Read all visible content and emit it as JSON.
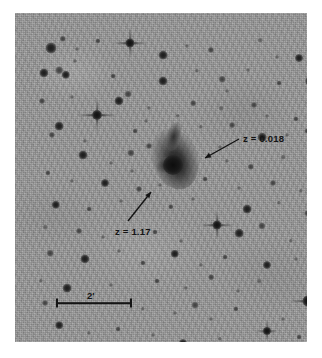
{
  "figure": {
    "kind": "astronomical-plate-image",
    "background_color": "#ffffff",
    "plate_color": "#9b9b9b",
    "ink_color": "#141414",
    "plate": {
      "left": 15,
      "top": 13,
      "width": 292,
      "height": 329
    }
  },
  "annotations": [
    {
      "name": "redshift-label-galaxy",
      "text": "z = 0.018",
      "label_x": 228,
      "label_y": 120,
      "font_size": 9.5,
      "arrow": {
        "x1": 224,
        "y1": 126,
        "x2": 190,
        "y2": 145
      }
    },
    {
      "name": "redshift-label-quasar",
      "text": "z = 1.17",
      "label_x": 100,
      "label_y": 213,
      "font_size": 9.5,
      "arrow": {
        "x1": 113,
        "y1": 208,
        "x2": 136,
        "y2": 179
      }
    }
  ],
  "scale_bar": {
    "name": "angular-scale-bar",
    "label": "2'",
    "value": 2,
    "unit": "arcmin",
    "x": 41,
    "y": 290,
    "length": 76,
    "label_x": 72,
    "label_y": 277,
    "font_size": 9.5
  },
  "galaxy": {
    "name": "central-galaxy",
    "x": 160,
    "y": 146,
    "halo_w": 46,
    "halo_h": 62,
    "nucleus_x": 158,
    "nucleus_y": 152,
    "nucleus_size": 20
  },
  "bright_stars": [
    {
      "x": 115,
      "y": 30,
      "core": 9,
      "spike_h": 34,
      "spike_v": 30
    },
    {
      "x": 82,
      "y": 102,
      "core": 10,
      "spike_h": 40,
      "spike_v": 34
    },
    {
      "x": 202,
      "y": 212,
      "core": 9,
      "spike_h": 34,
      "spike_v": 30
    },
    {
      "x": 293,
      "y": 288,
      "core": 11,
      "spike_h": 38,
      "spike_v": 34
    },
    {
      "x": 252,
      "y": 318,
      "core": 8,
      "spike_h": 22,
      "spike_v": 20
    }
  ],
  "stars": [
    {
      "x": 36,
      "y": 35,
      "r": 5.5,
      "c": ""
    },
    {
      "x": 48,
      "y": 26,
      "r": 3.2,
      "c": "faint"
    },
    {
      "x": 62,
      "y": 36,
      "r": 2.0,
      "c": "vfaint"
    },
    {
      "x": 83,
      "y": 28,
      "r": 2.6,
      "c": "faint"
    },
    {
      "x": 148,
      "y": 42,
      "r": 4.4,
      "c": ""
    },
    {
      "x": 172,
      "y": 33,
      "r": 2.1,
      "c": "vfaint"
    },
    {
      "x": 196,
      "y": 37,
      "r": 3.1,
      "c": "faint"
    },
    {
      "x": 245,
      "y": 27,
      "r": 2.3,
      "c": "vfaint"
    },
    {
      "x": 262,
      "y": 44,
      "r": 2.0,
      "c": "vfaint"
    },
    {
      "x": 284,
      "y": 45,
      "r": 4.0,
      "c": ""
    },
    {
      "x": 299,
      "y": 38,
      "r": 2.2,
      "c": "vfaint"
    },
    {
      "x": 29,
      "y": 60,
      "r": 4.6,
      "c": ""
    },
    {
      "x": 51,
      "y": 62,
      "r": 4.2,
      "c": ""
    },
    {
      "x": 44,
      "y": 57,
      "r": 3.8,
      "c": "faint"
    },
    {
      "x": 98,
      "y": 63,
      "r": 2.4,
      "c": "faint"
    },
    {
      "x": 148,
      "y": 68,
      "r": 4.5,
      "c": ""
    },
    {
      "x": 182,
      "y": 58,
      "r": 2.2,
      "c": "vfaint"
    },
    {
      "x": 207,
      "y": 66,
      "r": 3.3,
      "c": "faint"
    },
    {
      "x": 233,
      "y": 57,
      "r": 2.0,
      "c": "vfaint"
    },
    {
      "x": 264,
      "y": 70,
      "r": 2.4,
      "c": "faint"
    },
    {
      "x": 295,
      "y": 68,
      "r": 4.8,
      "c": ""
    },
    {
      "x": 27,
      "y": 88,
      "r": 3.0,
      "c": "faint"
    },
    {
      "x": 57,
      "y": 84,
      "r": 2.0,
      "c": "vfaint"
    },
    {
      "x": 104,
      "y": 88,
      "r": 4.6,
      "c": ""
    },
    {
      "x": 113,
      "y": 81,
      "r": 3.4,
      "c": "faint"
    },
    {
      "x": 134,
      "y": 95,
      "r": 2.1,
      "c": "vfaint"
    },
    {
      "x": 178,
      "y": 90,
      "r": 2.8,
      "c": "faint"
    },
    {
      "x": 206,
      "y": 95,
      "r": 2.3,
      "c": "vfaint"
    },
    {
      "x": 239,
      "y": 92,
      "r": 3.0,
      "c": "faint"
    },
    {
      "x": 252,
      "y": 103,
      "r": 2.0,
      "c": "vfaint"
    },
    {
      "x": 281,
      "y": 106,
      "r": 2.6,
      "c": "faint"
    },
    {
      "x": 44,
      "y": 113,
      "r": 4.4,
      "c": ""
    },
    {
      "x": 37,
      "y": 122,
      "r": 3.1,
      "c": "faint"
    },
    {
      "x": 70,
      "y": 128,
      "r": 2.1,
      "c": "vfaint"
    },
    {
      "x": 120,
      "y": 118,
      "r": 2.4,
      "c": "faint"
    },
    {
      "x": 131,
      "y": 108,
      "r": 2.0,
      "c": "vfaint"
    },
    {
      "x": 186,
      "y": 114,
      "r": 2.2,
      "c": "vfaint"
    },
    {
      "x": 217,
      "y": 112,
      "r": 2.9,
      "c": "faint"
    },
    {
      "x": 247,
      "y": 124,
      "r": 4.3,
      "c": ""
    },
    {
      "x": 292,
      "y": 118,
      "r": 2.5,
      "c": "faint"
    },
    {
      "x": 68,
      "y": 142,
      "r": 4.5,
      "c": ""
    },
    {
      "x": 96,
      "y": 150,
      "r": 2.0,
      "c": "vfaint"
    },
    {
      "x": 116,
      "y": 140,
      "r": 3.6,
      "c": "faint"
    },
    {
      "x": 134,
      "y": 133,
      "r": 3.0,
      "c": "faint"
    },
    {
      "x": 212,
      "y": 148,
      "r": 2.1,
      "c": "vfaint"
    },
    {
      "x": 236,
      "y": 154,
      "r": 3.2,
      "c": "faint"
    },
    {
      "x": 268,
      "y": 144,
      "r": 2.3,
      "c": "vfaint"
    },
    {
      "x": 296,
      "y": 150,
      "r": 3.8,
      "c": ""
    },
    {
      "x": 33,
      "y": 160,
      "r": 2.6,
      "c": "faint"
    },
    {
      "x": 57,
      "y": 168,
      "r": 2.1,
      "c": "vfaint"
    },
    {
      "x": 90,
      "y": 170,
      "r": 4.0,
      "c": ""
    },
    {
      "x": 124,
      "y": 176,
      "r": 3.0,
      "c": "faint"
    },
    {
      "x": 145,
      "y": 172,
      "r": 2.0,
      "c": "vfaint"
    },
    {
      "x": 190,
      "y": 166,
      "r": 2.4,
      "c": "faint"
    },
    {
      "x": 224,
      "y": 175,
      "r": 2.0,
      "c": "vfaint"
    },
    {
      "x": 258,
      "y": 170,
      "r": 3.0,
      "c": "faint"
    },
    {
      "x": 286,
      "y": 178,
      "r": 2.2,
      "c": "vfaint"
    },
    {
      "x": 41,
      "y": 192,
      "r": 4.2,
      "c": ""
    },
    {
      "x": 74,
      "y": 196,
      "r": 2.4,
      "c": "faint"
    },
    {
      "x": 106,
      "y": 188,
      "r": 2.0,
      "c": "vfaint"
    },
    {
      "x": 156,
      "y": 194,
      "r": 2.7,
      "c": "faint"
    },
    {
      "x": 178,
      "y": 186,
      "r": 2.0,
      "c": "vfaint"
    },
    {
      "x": 232,
      "y": 196,
      "r": 4.4,
      "c": ""
    },
    {
      "x": 264,
      "y": 190,
      "r": 2.2,
      "c": "vfaint"
    },
    {
      "x": 292,
      "y": 200,
      "r": 2.8,
      "c": "faint"
    },
    {
      "x": 30,
      "y": 214,
      "r": 2.3,
      "c": "vfaint"
    },
    {
      "x": 64,
      "y": 218,
      "r": 3.0,
      "c": "faint"
    },
    {
      "x": 88,
      "y": 224,
      "r": 2.0,
      "c": "vfaint"
    },
    {
      "x": 140,
      "y": 219,
      "r": 2.5,
      "c": "faint"
    },
    {
      "x": 166,
      "y": 228,
      "r": 2.0,
      "c": "vfaint"
    },
    {
      "x": 224,
      "y": 220,
      "r": 4.3,
      "c": ""
    },
    {
      "x": 247,
      "y": 213,
      "r": 3.6,
      "c": "faint"
    },
    {
      "x": 276,
      "y": 228,
      "r": 2.2,
      "c": "vfaint"
    },
    {
      "x": 35,
      "y": 240,
      "r": 3.3,
      "c": "faint"
    },
    {
      "x": 70,
      "y": 246,
      "r": 4.6,
      "c": ""
    },
    {
      "x": 104,
      "y": 238,
      "r": 2.0,
      "c": "vfaint"
    },
    {
      "x": 128,
      "y": 250,
      "r": 2.6,
      "c": "faint"
    },
    {
      "x": 160,
      "y": 241,
      "r": 4.2,
      "c": ""
    },
    {
      "x": 186,
      "y": 252,
      "r": 2.1,
      "c": "vfaint"
    },
    {
      "x": 210,
      "y": 244,
      "r": 2.4,
      "c": "faint"
    },
    {
      "x": 252,
      "y": 252,
      "r": 4.0,
      "c": ""
    },
    {
      "x": 281,
      "y": 246,
      "r": 2.0,
      "c": "vfaint"
    },
    {
      "x": 26,
      "y": 268,
      "r": 2.2,
      "c": "vfaint"
    },
    {
      "x": 52,
      "y": 275,
      "r": 4.4,
      "c": ""
    },
    {
      "x": 30,
      "y": 290,
      "r": 3.0,
      "c": "faint"
    },
    {
      "x": 96,
      "y": 272,
      "r": 2.0,
      "c": "vfaint"
    },
    {
      "x": 142,
      "y": 268,
      "r": 2.5,
      "c": "faint"
    },
    {
      "x": 171,
      "y": 275,
      "r": 2.1,
      "c": "vfaint"
    },
    {
      "x": 196,
      "y": 264,
      "r": 2.8,
      "c": "faint"
    },
    {
      "x": 223,
      "y": 278,
      "r": 2.0,
      "c": "vfaint"
    },
    {
      "x": 244,
      "y": 268,
      "r": 2.3,
      "c": "vfaint"
    },
    {
      "x": 128,
      "y": 296,
      "r": 2.2,
      "c": "vfaint"
    },
    {
      "x": 160,
      "y": 300,
      "r": 2.0,
      "c": "vfaint"
    },
    {
      "x": 180,
      "y": 292,
      "r": 3.4,
      "c": "faint"
    },
    {
      "x": 196,
      "y": 306,
      "r": 2.0,
      "c": "vfaint"
    },
    {
      "x": 221,
      "y": 296,
      "r": 2.6,
      "c": "faint"
    },
    {
      "x": 268,
      "y": 306,
      "r": 2.0,
      "c": "vfaint"
    },
    {
      "x": 44,
      "y": 312,
      "r": 3.8,
      "c": ""
    },
    {
      "x": 74,
      "y": 320,
      "r": 2.1,
      "c": "vfaint"
    },
    {
      "x": 103,
      "y": 316,
      "r": 2.4,
      "c": "faint"
    },
    {
      "x": 138,
      "y": 322,
      "r": 2.0,
      "c": "vfaint"
    },
    {
      "x": 168,
      "y": 330,
      "r": 4.0,
      "c": ""
    },
    {
      "x": 205,
      "y": 326,
      "r": 2.2,
      "c": "vfaint"
    },
    {
      "x": 236,
      "y": 332,
      "r": 2.0,
      "c": "vfaint"
    },
    {
      "x": 284,
      "y": 324,
      "r": 2.4,
      "c": "faint"
    },
    {
      "x": 302,
      "y": 262,
      "r": 3.0,
      "c": "faint"
    },
    {
      "x": 60,
      "y": 48,
      "r": 2.0,
      "c": "vfaint"
    },
    {
      "x": 212,
      "y": 78,
      "r": 2.0,
      "c": "vfaint"
    },
    {
      "x": 163,
      "y": 103,
      "r": 2.2,
      "c": "vfaint"
    },
    {
      "x": 117,
      "y": 158,
      "r": 2.0,
      "c": "vfaint"
    },
    {
      "x": 205,
      "y": 134,
      "r": 2.0,
      "c": "vfaint"
    },
    {
      "x": 272,
      "y": 122,
      "r": 2.0,
      "c": "vfaint"
    }
  ]
}
